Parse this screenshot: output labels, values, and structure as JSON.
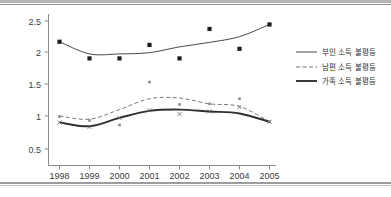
{
  "chart_data": {
    "type": "line",
    "title": "",
    "xlabel": "",
    "ylabel": "",
    "x": [
      1998,
      1999,
      2000,
      2001,
      2002,
      2003,
      2004,
      2005
    ],
    "tick_labels_x": [
      "1998",
      "1999",
      "2000",
      "2001",
      "2002",
      "2003",
      "2004",
      "2005"
    ],
    "tick_labels_y": [
      "0.5",
      "1",
      "1.5",
      "2",
      "2.5"
    ],
    "ytick_values": [
      0.5,
      1,
      1.5,
      2,
      2.5
    ],
    "ylim": [
      0.35,
      2.62
    ],
    "grid": false,
    "legend_position": "right",
    "series": [
      {
        "name": "부인 소득 불평등",
        "style": "solid-thin",
        "color": "#4a4a4a",
        "values": [
          2.16,
          1.97,
          1.97,
          1.99,
          2.08,
          2.15,
          2.24,
          2.43
        ],
        "marker": "square",
        "marker_values": [
          2.16,
          1.9,
          1.9,
          2.11,
          1.9,
          2.36,
          2.05,
          2.43
        ]
      },
      {
        "name": "남편 소득 불평등",
        "style": "dashed",
        "color": "#7a7a7a",
        "values": [
          1.0,
          0.95,
          1.1,
          1.27,
          1.28,
          1.19,
          1.15,
          0.91
        ],
        "marker": "dot",
        "marker_values": [
          0.99,
          0.93,
          0.86,
          1.53,
          1.18,
          1.19,
          1.27,
          0.91
        ]
      },
      {
        "name": "가족 소득 불평등",
        "style": "solid-thick",
        "color": "#2f2f2f",
        "values": [
          0.9,
          0.84,
          0.97,
          1.08,
          1.1,
          1.07,
          1.04,
          0.91
        ],
        "marker": "x",
        "marker_values": [
          0.9,
          0.83,
          0.97,
          1.09,
          1.03,
          1.07,
          1.14,
          0.91
        ]
      }
    ]
  },
  "legend": {
    "entries": [
      {
        "label": "부인 소득 불평등"
      },
      {
        "label": "남편 소득 불평등"
      },
      {
        "label": "가족 소득 불평등"
      }
    ]
  },
  "axes": {
    "y_ticks": [
      {
        "label": "2.5"
      },
      {
        "label": "2"
      },
      {
        "label": "1.5"
      },
      {
        "label": "1"
      },
      {
        "label": "0.5"
      }
    ],
    "x_ticks": [
      {
        "label": "1998"
      },
      {
        "label": "1999"
      },
      {
        "label": "2000"
      },
      {
        "label": "2001"
      },
      {
        "label": "2002"
      },
      {
        "label": "2003"
      },
      {
        "label": "2004"
      },
      {
        "label": "2005"
      }
    ]
  }
}
